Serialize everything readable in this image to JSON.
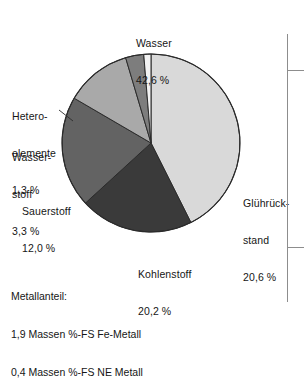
{
  "chart_data": {
    "type": "pie",
    "title": "",
    "unit": "%",
    "legend_position": "outside-labels",
    "grid": false,
    "categories": [
      "Wasser",
      "Glührückstand",
      "Kohlenstoff",
      "Sauerstoff",
      "Wasserstoff",
      "Heteroelemente"
    ],
    "values": [
      42.6,
      20.6,
      20.2,
      12.0,
      3.3,
      1.3
    ],
    "colors": [
      "#d9d9d9",
      "#3a3a3a",
      "#636363",
      "#a9a9a9",
      "#7d7d7d",
      "#f2f2f2"
    ],
    "slices": [
      {
        "name": "Wasser",
        "value": 42.6,
        "value_text": "42,6 %",
        "label": "Wasser",
        "color": "#d9d9d9",
        "start_deg": 0,
        "sweep_deg": 153.36
      },
      {
        "name": "Glührückstand",
        "value": 20.6,
        "value_text": "20,6 %",
        "label": "Glührück-stand",
        "color": "#3a3a3a",
        "start_deg": 153.36,
        "sweep_deg": 74.16
      },
      {
        "name": "Kohlenstoff",
        "value": 20.2,
        "value_text": "20,2 %",
        "label": "Kohlenstoff",
        "color": "#636363",
        "start_deg": 227.52,
        "sweep_deg": 72.72
      },
      {
        "name": "Sauerstoff",
        "value": 12.0,
        "value_text": "12,0 %",
        "label": "Sauerstoff",
        "color": "#a9a9a9",
        "start_deg": 300.24,
        "sweep_deg": 43.2
      },
      {
        "name": "Wasserstoff",
        "value": 3.3,
        "value_text": "3,3 %",
        "label": "Wasser-stoff",
        "color": "#7d7d7d",
        "start_deg": 343.44,
        "sweep_deg": 11.88
      },
      {
        "name": "Heteroelemente",
        "value": 1.3,
        "value_text": "1,3 %",
        "label": "Hetero-elemente",
        "color": "#f2f2f2",
        "start_deg": 355.32,
        "sweep_deg": 4.68
      }
    ]
  },
  "labels": {
    "wasser": {
      "line1": "Wasser",
      "line2": "42,6 %"
    },
    "hetero": {
      "line1": "Hetero-",
      "line2": "elemente",
      "line3": "1,3 %"
    },
    "wasserstoff": {
      "line1": "Wasser-",
      "line2": "stoff",
      "line3": "3,3 %"
    },
    "sauerstoff": {
      "line1": "Sauerstoff",
      "line2": "12,0 %"
    },
    "gluehrueckstand": {
      "line1": "Glührück-",
      "line2": "stand",
      "line3": "20,6 %"
    },
    "kohlenstoff": {
      "line1": "Kohlenstoff",
      "line2": "20,2 %"
    }
  },
  "footnote": {
    "line1": "Metallanteil:",
    "line2": "1,9 Massen %-FS Fe-Metall",
    "line3": "0,4 Massen %-FS NE Metall"
  },
  "style": {
    "background": "#ffffff",
    "text_color": "#161616",
    "outline_color": "#2b2b2b",
    "rule_color": "#8d8d8d"
  }
}
